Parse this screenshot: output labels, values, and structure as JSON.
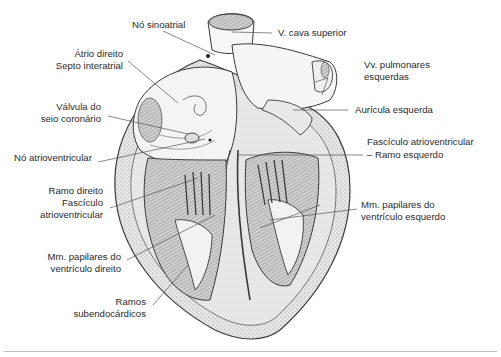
{
  "figure": {
    "labels_left": [
      {
        "id": "no-sinoatrial",
        "lines": [
          "Nó sinoatrial"
        ]
      },
      {
        "id": "atrio-direito",
        "lines": [
          "Átrio direito"
        ]
      },
      {
        "id": "septo-interatrial",
        "lines": [
          "Septo interatrial"
        ]
      },
      {
        "id": "valvula-seio-coronario",
        "lines": [
          "Válvula do",
          "seio coronário"
        ]
      },
      {
        "id": "no-atrioventricular",
        "lines": [
          "Nó atrioventricular"
        ]
      },
      {
        "id": "ramo-direito-fasciculo",
        "lines": [
          "Ramo direito",
          "Fascículo",
          "atrioventricular"
        ]
      },
      {
        "id": "mm-papilares-vd",
        "lines": [
          "Mm. papilares do",
          "ventrículo direito"
        ]
      },
      {
        "id": "ramos-subendocardicos",
        "lines": [
          "Ramos",
          "subendocárdicos"
        ]
      }
    ],
    "labels_right": [
      {
        "id": "v-cava-superior",
        "lines": [
          "V. cava superior"
        ]
      },
      {
        "id": "vv-pulmonares",
        "lines": [
          "Vv. pulmonares",
          "esquerdas"
        ]
      },
      {
        "id": "auricula-esquerda",
        "lines": [
          "Aurícula esquerda"
        ]
      },
      {
        "id": "fasciculo-ramo-esquerdo",
        "lines": [
          "Fascículo atrioventricular",
          "– Ramo esquerdo"
        ]
      },
      {
        "id": "mm-papilares-ve",
        "lines": [
          "Mm. papilares do",
          "ventrículo esquerdo"
        ]
      }
    ],
    "colors": {
      "text": "#2a2a2a",
      "leader": "#555555",
      "outline": "#3a3a3a",
      "fill_light": "#f2f2f2",
      "fill_mid": "#d9d9d9",
      "fill_dark": "#8a8a8a",
      "rule": "#bdbdbd"
    }
  }
}
